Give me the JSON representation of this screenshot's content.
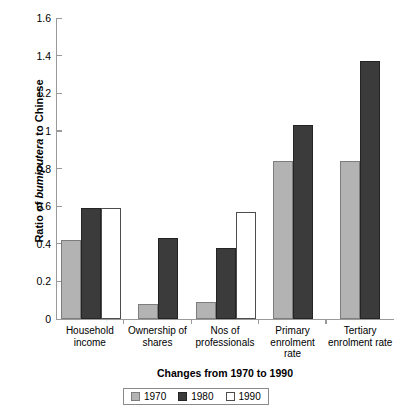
{
  "chart_data": {
    "type": "bar",
    "title": "",
    "xlabel": "Changes from 1970 to 1990",
    "ylabel": "Ratio of bumiputera to Chinese",
    "ylabel_parts": {
      "prefix": "Ratio of ",
      "italic": "bumiputera",
      "suffix": " to Chinese"
    },
    "categories": [
      "Household income",
      "Ownership of shares",
      "Nos of professionals",
      "Primary enrolment rate",
      "Tertiary enrolment rate"
    ],
    "category_lines": [
      [
        "Household",
        "income"
      ],
      [
        "Ownership of",
        "shares"
      ],
      [
        "Nos of",
        "professionals"
      ],
      [
        "Primary",
        "enrolment",
        "rate"
      ],
      [
        "Tertiary",
        "enrolment rate"
      ]
    ],
    "series": [
      {
        "name": "1970",
        "color": "#b3b3b3",
        "values": [
          0.42,
          0.08,
          0.09,
          0.84,
          0.84
        ]
      },
      {
        "name": "1980",
        "color": "#3b3b3b",
        "values": [
          0.59,
          0.43,
          0.375,
          1.03,
          1.37
        ]
      },
      {
        "name": "1990",
        "color": "#ffffff",
        "values": [
          0.59,
          null,
          0.57,
          null,
          null
        ]
      }
    ],
    "ylim": [
      0,
      1.6
    ],
    "yticks": [
      0,
      0.2,
      0.4,
      0.6,
      0.8,
      1,
      1.2,
      1.4,
      1.6
    ],
    "ytick_labels": [
      "0",
      "0.2",
      "0.4",
      "0.6",
      "0.8",
      "1",
      "1.2",
      "1.4",
      "1.6"
    ],
    "grid": false,
    "legend_position": "bottom",
    "legend": [
      "1970",
      "1980",
      "1990"
    ]
  }
}
